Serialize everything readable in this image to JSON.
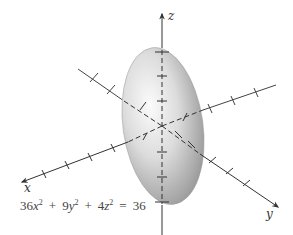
{
  "figure": {
    "equation": {
      "display": "36x² + 9y² + 4z² = 36",
      "terms": [
        {
          "coef": "36",
          "var": "x",
          "exp": "2"
        },
        {
          "op": "+"
        },
        {
          "coef": "9",
          "var": "y",
          "exp": "2"
        },
        {
          "op": "+"
        },
        {
          "coef": "4",
          "var": "z",
          "exp": "2"
        },
        {
          "op": "="
        },
        {
          "value": "36"
        }
      ]
    },
    "axes": {
      "x_label": "x",
      "y_label": "y",
      "z_label": "z"
    },
    "colors": {
      "axis": "#333333",
      "surface_light": "#f4f4f4",
      "surface_dark": "#8a8a8a",
      "text": "#444444"
    }
  }
}
